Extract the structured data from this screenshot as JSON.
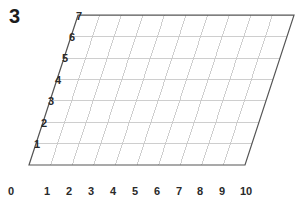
{
  "figure": {
    "number": "3",
    "background_color": "#ffffff",
    "grid_border_color": "#555555",
    "grid_line_color": "#c9c9c9",
    "label_color": "#2a2a2a"
  },
  "chart_data": {
    "type": "grid",
    "title": "",
    "subtitle": "",
    "xlabel": "",
    "ylabel": "",
    "xlim": [
      0,
      10
    ],
    "ylim": [
      0,
      7
    ],
    "x_ticks": [
      0,
      1,
      2,
      3,
      4,
      5,
      6,
      7,
      8,
      9,
      10
    ],
    "x_tick_labels": [
      "0",
      "1",
      "2",
      "3",
      "4",
      "5",
      "6",
      "7",
      "8",
      "9",
      "10"
    ],
    "y_ticks": [
      1,
      2,
      3,
      4,
      5,
      6,
      7
    ],
    "y_tick_labels": [
      "1",
      "2",
      "3",
      "4",
      "5",
      "6",
      "7"
    ],
    "grid": true,
    "legend": false,
    "series": [],
    "values": [],
    "annotations": [
      {
        "text": "3",
        "role": "figure-number"
      }
    ],
    "geometry": {
      "shear_per_unit_y": 7.0,
      "x_unit_px": 21.6,
      "y_unit_px": 21.4,
      "origin_px": {
        "x": 29,
        "y": 165
      },
      "corners_px": [
        {
          "x": 29,
          "y": 165
        },
        {
          "x": 245,
          "y": 165
        },
        {
          "x": 295,
          "y": 15
        },
        {
          "x": 79,
          "y": 15
        }
      ]
    }
  },
  "x_axis": {
    "labels": [
      {
        "text": "0",
        "x": 11,
        "y": 186
      },
      {
        "text": "1",
        "x": 47,
        "y": 186
      },
      {
        "text": "2",
        "x": 69,
        "y": 186
      },
      {
        "text": "3",
        "x": 91,
        "y": 186
      },
      {
        "text": "4",
        "x": 113,
        "y": 186
      },
      {
        "text": "5",
        "x": 135,
        "y": 186
      },
      {
        "text": "6",
        "x": 157,
        "y": 186
      },
      {
        "text": "7",
        "x": 179,
        "y": 186
      },
      {
        "text": "8",
        "x": 200,
        "y": 186
      },
      {
        "text": "9",
        "x": 222,
        "y": 186
      },
      {
        "text": "10",
        "x": 246,
        "y": 186
      }
    ]
  },
  "y_axis": {
    "labels": [
      {
        "text": "1",
        "x": 40,
        "y": 144
      },
      {
        "text": "2",
        "x": 47,
        "y": 123
      },
      {
        "text": "3",
        "x": 54,
        "y": 101
      },
      {
        "text": "4",
        "x": 61,
        "y": 80
      },
      {
        "text": "5",
        "x": 68,
        "y": 58
      },
      {
        "text": "6",
        "x": 75,
        "y": 37
      },
      {
        "text": "7",
        "x": 82,
        "y": 16
      }
    ]
  }
}
